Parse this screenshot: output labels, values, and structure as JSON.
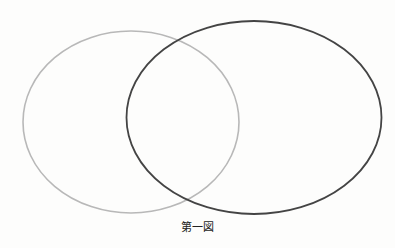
{
  "diagram": {
    "type": "venn",
    "caption": "第一図",
    "ellipses": [
      {
        "name": "left-ellipse",
        "cx": 131,
        "cy": 122,
        "rx": 108,
        "ry": 91,
        "stroke": "#b8b8b8",
        "stroke_width": 1.6
      },
      {
        "name": "right-ellipse",
        "cx": 254,
        "cy": 117.5,
        "rx": 127.5,
        "ry": 96.5,
        "stroke": "#444444",
        "stroke_width": 1.8
      }
    ]
  }
}
